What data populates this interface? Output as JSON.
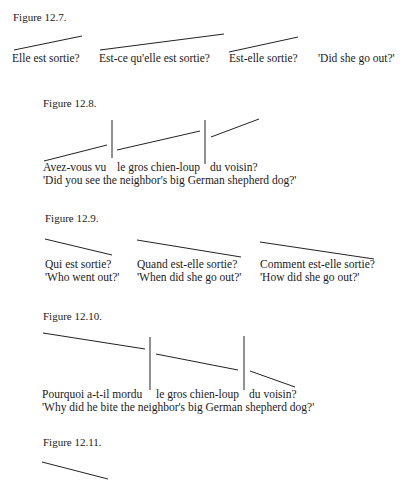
{
  "figures": [
    {
      "caption": "Figure 12.7.",
      "items": [
        "Elle est sortie?",
        "Est-ce qu'elle est sortie?",
        "Est-elle sortie?",
        "'Did she go out?'"
      ]
    },
    {
      "caption": "Figure 12.8.",
      "items": [
        "Avez-vous vu",
        "le gros chien-loup",
        "du voisin?"
      ],
      "gloss": "'Did you see the neighbor's big German shepherd dog?'"
    },
    {
      "caption": "Figure 12.9.",
      "items": [
        {
          "french": "Qui est sortie?",
          "gloss": "'Who went out?'"
        },
        {
          "french": "Quand est-elle sortie?",
          "gloss": "'When did she go out?'"
        },
        {
          "french": "Comment est-elle sortie?",
          "gloss": "'How did she go out?'"
        }
      ]
    },
    {
      "caption": "Figure 12.10.",
      "items": [
        "Pourquoi a-t-il mordu",
        "le gros chien-loup",
        "du voisin?"
      ],
      "gloss": "'Why did he bite the neighbor's big German shepherd dog?'"
    },
    {
      "caption": "Figure 12.11.",
      "items": []
    }
  ]
}
